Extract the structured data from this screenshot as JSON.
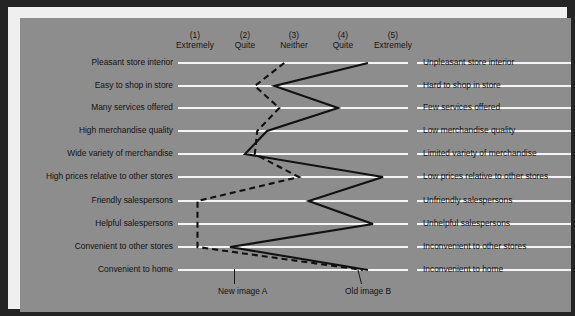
{
  "chart_data": {
    "type": "line",
    "title": "",
    "subtitle": "",
    "xlabel": "",
    "ylabel": "",
    "orientation": "horizontal-scale-rows",
    "grid": true,
    "xlim": [
      1,
      5
    ],
    "legend_position": "bottom",
    "scale": {
      "numbers": [
        "(1)",
        "(2)",
        "(3)",
        "(4)",
        "(5)"
      ],
      "words": [
        "Extremely",
        "Quite",
        "Neither",
        "Quite",
        "Extremely"
      ]
    },
    "categories": [
      {
        "left": "Pleasant store interior",
        "right": "Unpleasant store interior"
      },
      {
        "left": "Easy to shop in store",
        "right": "Hard to shop in store"
      },
      {
        "left": "Many services offered",
        "right": "Few services offered"
      },
      {
        "left": "High merchandise quality",
        "right": "Low merchandise quality"
      },
      {
        "left": "Wide variety of merchandise",
        "right": "Limited variety of merchandise"
      },
      {
        "left": "High prices relative to other stores",
        "right": "Low prices relative to other stores"
      },
      {
        "left": "Friendly salespersons",
        "right": "Unfriendly salespersons"
      },
      {
        "left": "Helpful salespersons",
        "right": "Unhelpful salespersons"
      },
      {
        "left": "Convenient to other stores",
        "right": "Inconvenient to other stores"
      },
      {
        "left": "Convenient to home",
        "right": "Inconvenient to home"
      }
    ],
    "series": [
      {
        "name": "New image A",
        "style": "dashed",
        "color": "#111111",
        "values": [
          2.8,
          2.2,
          2.7,
          2.25,
          2.2,
          3.1,
          1.05,
          1.05,
          1.05,
          4.4
        ]
      },
      {
        "name": "Old image B",
        "style": "solid",
        "color": "#111111",
        "values": [
          4.5,
          2.6,
          3.9,
          2.45,
          2.0,
          4.8,
          3.3,
          4.6,
          1.7,
          4.5
        ]
      }
    ]
  },
  "legend": {
    "new_image": "New image A",
    "old_image": "Old image B"
  },
  "colors": {
    "frame": "#242424",
    "inner_border": "#efefef",
    "plot_background": "#8d8d8d",
    "gridline": "#f4f4f4",
    "line": "#111111",
    "text": "#131313"
  }
}
